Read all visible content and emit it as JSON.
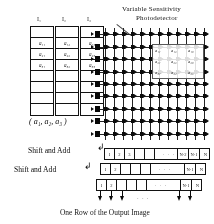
{
  "figure": {
    "title": "Variable Sensitivity Photodetector",
    "title_line1": "Variable Sensitivity",
    "title_line2": "Photodetector",
    "caption": "One Row of the Output Image",
    "vector_label": "( a₁, a₂, a₃ )",
    "shift_and_add_1": "Shift and Add",
    "shift_and_add_2": "Shift and Add"
  },
  "input_columns": [
    {
      "header": "I₁",
      "cells": [
        "",
        "a₁₁",
        "a₂₁",
        "a₃₁",
        "",
        "",
        "",
        ""
      ]
    },
    {
      "header": "I₂",
      "cells": [
        "",
        "a₁₂",
        "a₂₂",
        "a₃₂",
        "",
        "",
        "",
        ""
      ]
    },
    {
      "header": "I₃",
      "cells": [
        "",
        "a₁₃",
        "a₂₃",
        "a₃₃",
        "",
        "",
        "",
        ""
      ]
    }
  ],
  "kernel": {
    "rows": [
      [
        "a₁₁",
        "a₁₂",
        "a₁₃"
      ],
      [
        "a₂₁",
        "a₂₂",
        "a₂₃"
      ],
      [
        "a₃₁",
        "a₃₂",
        "a₃₃"
      ]
    ]
  },
  "detector_array": {
    "columns": 12,
    "rows": 9
  },
  "output_rows": [
    {
      "left_cells": [
        "1",
        "2",
        "3",
        "",
        ""
      ],
      "right_cells": [
        "N-2",
        "N-1",
        "N"
      ],
      "ellipsis": "· · ·"
    },
    {
      "left_cells": [
        "1",
        "2",
        "",
        "",
        ""
      ],
      "right_cells": [
        "N-1",
        "N"
      ],
      "ellipsis": "· · ·"
    },
    {
      "left_cells": [
        "1",
        "2",
        "",
        "",
        ""
      ],
      "right_cells": [
        "N-1",
        "N"
      ],
      "ellipsis": "· · ·"
    }
  ],
  "colors": {
    "ink": "#1a1a1a",
    "paper": "#ffffff",
    "node": "#141414"
  }
}
